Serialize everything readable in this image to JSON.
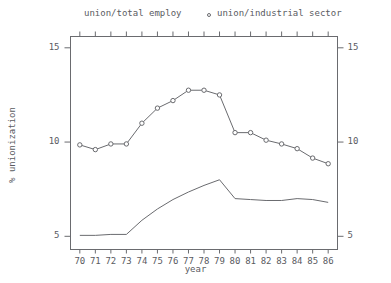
{
  "chart_data": {
    "type": "line",
    "title": "",
    "xlabel": "year",
    "ylabel": "% unionization",
    "x": [
      70,
      71,
      72,
      73,
      74,
      75,
      76,
      77,
      78,
      79,
      80,
      81,
      82,
      83,
      84,
      85,
      86
    ],
    "xtick_labels": [
      "70",
      "71",
      "72",
      "73",
      "74",
      "75",
      "76",
      "77",
      "78",
      "79",
      "80",
      "81",
      "82",
      "83",
      "84",
      "85",
      "86"
    ],
    "ytick_labels_left": [
      "15",
      "10",
      "5"
    ],
    "ytick_labels_right": [
      "15",
      "10",
      "5"
    ],
    "yticks": [
      15,
      10,
      5
    ],
    "ylim": [
      4.3,
      15.6
    ],
    "xlim": [
      69.4,
      86.6
    ],
    "grid": false,
    "legend_position": "top",
    "series": [
      {
        "name": "union/total employ",
        "marker": "none",
        "color": "#6a6b6f",
        "values": [
          5.05,
          5.05,
          5.1,
          5.1,
          5.85,
          6.45,
          6.95,
          7.35,
          7.7,
          8.0,
          7.0,
          6.95,
          6.9,
          6.9,
          7.0,
          6.95,
          6.8
        ]
      },
      {
        "name": "union/industrial sector",
        "marker": "circle",
        "color": "#6a6b6f",
        "values": [
          9.85,
          9.6,
          9.9,
          9.9,
          11.0,
          11.8,
          12.2,
          12.75,
          12.75,
          12.5,
          10.5,
          10.5,
          10.1,
          9.9,
          9.65,
          9.15,
          8.85
        ]
      }
    ]
  },
  "legend": {
    "series_total_label": "union/total employ",
    "series_industrial_label": "union/industrial sector",
    "industrial_marker_icon": "circle-marker-icon"
  },
  "axes": {
    "y_title": "% unionization",
    "x_title": "year"
  }
}
